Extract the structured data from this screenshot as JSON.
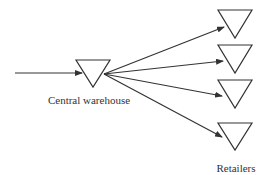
{
  "diagram": {
    "type": "distribution-network",
    "stroke_color": "#333333",
    "background": "#ffffff",
    "source_arrow": {
      "from": [
        15,
        73
      ],
      "to": [
        82,
        73
      ]
    },
    "central": {
      "label": "Central warehouse",
      "shape": "inverted-triangle",
      "top_left": [
        76,
        60
      ],
      "top_right": [
        110,
        60
      ],
      "apex": [
        93,
        87
      ],
      "label_pos": [
        89,
        104
      ]
    },
    "retailers_label": {
      "text": "Retailers",
      "pos": [
        236,
        172
      ]
    },
    "retailers": [
      {
        "id": "retailer-1",
        "top_left": [
          218,
          10
        ],
        "top_right": [
          252,
          10
        ],
        "apex": [
          235,
          38
        ],
        "arrow_from": [
          104,
          74
        ],
        "arrow_to": [
          224,
          27
        ]
      },
      {
        "id": "retailer-2",
        "top_left": [
          218,
          45
        ],
        "top_right": [
          252,
          45
        ],
        "apex": [
          235,
          73
        ],
        "arrow_from": [
          104,
          74
        ],
        "arrow_to": [
          223,
          61
        ]
      },
      {
        "id": "retailer-3",
        "top_left": [
          218,
          80
        ],
        "top_right": [
          252,
          80
        ],
        "apex": [
          235,
          108
        ],
        "arrow_from": [
          104,
          74
        ],
        "arrow_to": [
          222,
          96
        ]
      },
      {
        "id": "retailer-4",
        "top_left": [
          218,
          123
        ],
        "top_right": [
          252,
          123
        ],
        "apex": [
          235,
          150
        ],
        "arrow_from": [
          104,
          74
        ],
        "arrow_to": [
          222,
          137
        ]
      }
    ]
  }
}
